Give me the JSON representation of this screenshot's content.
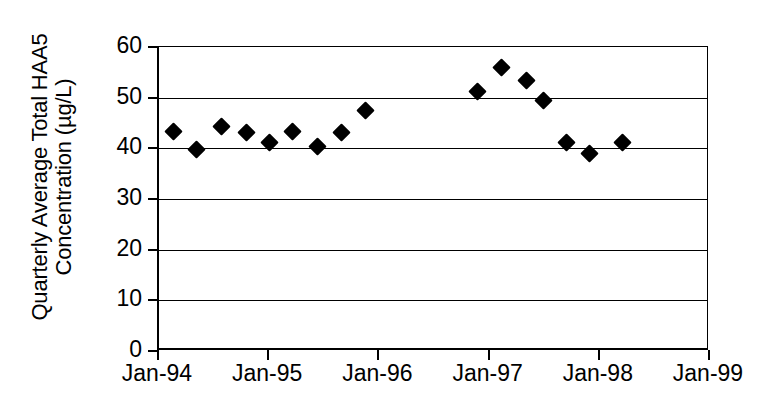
{
  "chart_data": {
    "type": "scatter",
    "title": "",
    "subtitle": "",
    "xlabel": "",
    "ylabel": "Quarterly Average Total HAA5 Concentration (µg/L)",
    "ylabel_lines": [
      "Quarterly Average Total HAA5",
      "Concentration (µg/L)"
    ],
    "ylim": [
      0,
      60
    ],
    "xlim": [
      "Jan-94",
      "Jan-99"
    ],
    "y_ticks": [
      0,
      10,
      20,
      30,
      40,
      50,
      60
    ],
    "y_tick_labels": [
      "0",
      "10",
      "20",
      "30",
      "40",
      "50",
      "60"
    ],
    "x_ticks": [
      "Jan-94",
      "Jan-95",
      "Jan-96",
      "Jan-97",
      "Jan-98",
      "Jan-99"
    ],
    "grid": "horizontal",
    "legend": null,
    "legend_position": "none",
    "marker": "diamond",
    "marker_color": "#000000",
    "series": [
      {
        "name": "Quarterly Average Total HAA5",
        "points": [
          {
            "x": "Apr-94",
            "x_frac": 0.136,
            "y": 43.4
          },
          {
            "x": "Jul-94",
            "x_frac": 0.336,
            "y": 39.8
          },
          {
            "x": "Oct-94",
            "x_frac": 0.563,
            "y": 44.3
          },
          {
            "x": "Jan-95",
            "x_frac": 0.79,
            "y": 43.2
          },
          {
            "x": "Apr-95",
            "x_frac": 1.0,
            "y": 41.2
          },
          {
            "x": "Jul-95",
            "x_frac": 1.209,
            "y": 43.4
          },
          {
            "x": "Oct-95",
            "x_frac": 1.436,
            "y": 40.4
          },
          {
            "x": "Jan-96",
            "x_frac": 1.654,
            "y": 43.2
          },
          {
            "x": "Apr-96",
            "x_frac": 1.872,
            "y": 47.5
          },
          {
            "x": "Jul-97",
            "x_frac": 2.89,
            "y": 51.2
          },
          {
            "x": "Oct-97",
            "x_frac": 3.108,
            "y": 56.0
          },
          {
            "x": "Jan-98",
            "x_frac": 3.335,
            "y": 53.3
          },
          {
            "x": "Apr-98",
            "x_frac": 3.49,
            "y": 49.4
          },
          {
            "x": "Jul-98",
            "x_frac": 3.699,
            "y": 41.2
          },
          {
            "x": "Oct-98",
            "x_frac": 3.908,
            "y": 38.9
          },
          {
            "x": "Jan-99",
            "x_frac": 4.208,
            "y": 41.2
          }
        ]
      }
    ]
  }
}
